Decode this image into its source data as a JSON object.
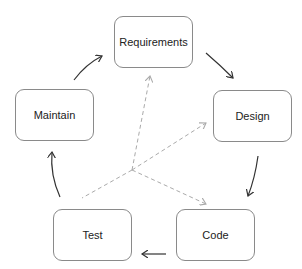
{
  "diagram": {
    "type": "cycle",
    "nodes": [
      {
        "id": "requirements",
        "label": "Requirements"
      },
      {
        "id": "design",
        "label": "Design"
      },
      {
        "id": "code",
        "label": "Code"
      },
      {
        "id": "test",
        "label": "Test"
      },
      {
        "id": "maintain",
        "label": "Maintain"
      }
    ],
    "cycle_edges": [
      {
        "from": "requirements",
        "to": "design",
        "style": "solid"
      },
      {
        "from": "design",
        "to": "code",
        "style": "solid"
      },
      {
        "from": "code",
        "to": "test",
        "style": "solid"
      },
      {
        "from": "test",
        "to": "maintain",
        "style": "solid"
      },
      {
        "from": "maintain",
        "to": "requirements",
        "style": "solid"
      }
    ],
    "dashed_edges": [
      {
        "from": "center",
        "to": "requirements",
        "style": "dashed"
      },
      {
        "from": "center",
        "to": "design",
        "style": "dashed"
      },
      {
        "from": "center",
        "to": "code",
        "style": "dashed"
      },
      {
        "from": "center",
        "to": "test",
        "style": "dashed"
      }
    ],
    "colors": {
      "solid_arrow": "#333333",
      "dashed_arrow": "#aaaaaa",
      "box_border": "#8a8a8a"
    }
  }
}
